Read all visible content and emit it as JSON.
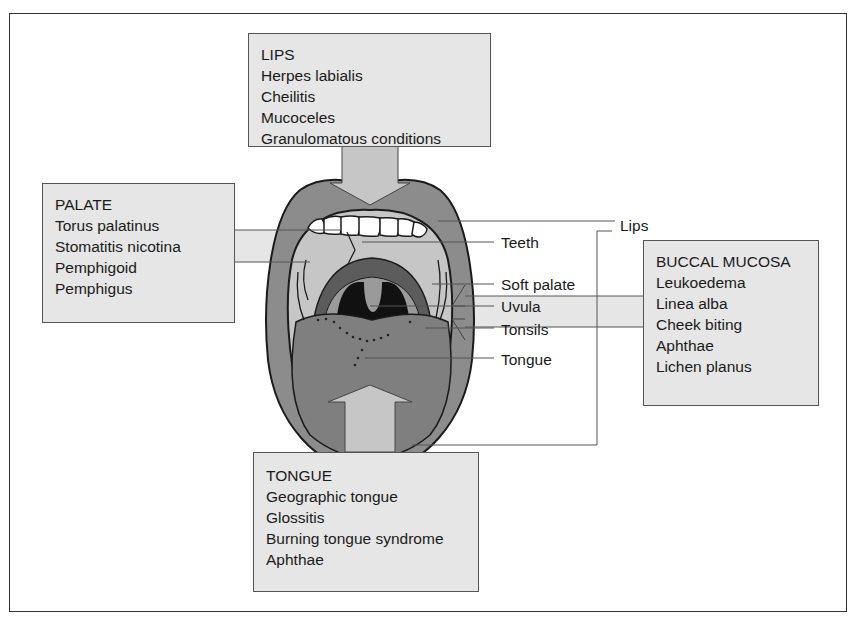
{
  "diagram": {
    "type": "anatomical-callout",
    "colors": {
      "box_fill": "#e6e6e6",
      "lip_fill": "#8c8c8c",
      "tongue_fill": "#7f7f7f",
      "pharynx_fill": "#111111",
      "palate_fill": "#c6c6c6",
      "frame_border": "#333333"
    }
  },
  "boxes": {
    "lips": {
      "title": "LIPS",
      "items": [
        "Herpes labialis",
        "Cheilitis",
        "Mucoceles",
        "Granulomatous conditions"
      ]
    },
    "palate": {
      "title": "PALATE",
      "items": [
        "Torus palatinus",
        "Stomatitis nicotina",
        "Pemphigoid",
        "Pemphigus"
      ]
    },
    "buccal_mucosa": {
      "title": "BUCCAL MUCOSA",
      "items": [
        "Leukoedema",
        "Linea alba",
        "Cheek biting",
        "Aphthae",
        "Lichen planus"
      ]
    },
    "tongue": {
      "title": "TONGUE",
      "items": [
        "Geographic tongue",
        "Glossitis",
        "Burning tongue syndrome",
        "Aphthae"
      ]
    }
  },
  "labels": {
    "lips": "Lips",
    "teeth": "Teeth",
    "soft_palate": "Soft palate",
    "uvula": "Uvula",
    "tonsils": "Tonsils",
    "tongue": "Tongue"
  }
}
